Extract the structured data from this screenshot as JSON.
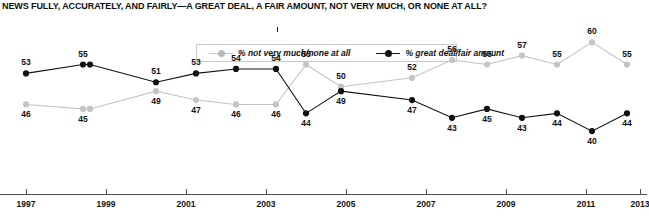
{
  "title": "NEWS FULLY, ACCURATELY, AND FAIRLY—A GREAT DEAL, A FAIR AMOUNT, NOT VERY MUCH, OR NONE AT ALL?",
  "legend": {
    "items": [
      {
        "label": "% not very much/none at all",
        "color": "#c4c4c4",
        "marker": "circle"
      },
      {
        "label": "% great deal/fair amount",
        "color": "#111111",
        "marker": "circle"
      }
    ]
  },
  "axis": {
    "x_ticks": [
      "1997",
      "1999",
      "2001",
      "2003",
      "2005",
      "2007",
      "2009",
      "2011",
      "2013"
    ]
  },
  "chart_data": {
    "type": "line",
    "title": "NEWS FULLY, ACCURATELY, AND FAIRLY—A GREAT DEAL, A FAIR AMOUNT, NOT VERY MUCH, OR NONE AT ALL?",
    "xlabel": "",
    "ylabel": "",
    "ylim": [
      38,
      62
    ],
    "grid": false,
    "legend_position": "top-center",
    "x": [
      1997,
      1999,
      1999.45,
      2001,
      2002,
      2003,
      2004,
      2005,
      2006,
      2008,
      2009,
      2010,
      2011,
      2012,
      2013,
      2014
    ],
    "x_pixels": [
      26,
      83,
      90,
      156,
      196,
      236,
      276,
      306,
      341,
      412,
      452,
      487,
      522,
      557,
      592,
      627
    ],
    "series": [
      {
        "name": "% not very much/none at all",
        "color": "#c4c4c4",
        "values": [
          46,
          45,
          45,
          49,
          47,
          46,
          46,
          55,
          50,
          52,
          56,
          55,
          57,
          55,
          60,
          55
        ],
        "label_side": "below_then_above",
        "labels": [
          {
            "value": 46,
            "pos": "below"
          },
          {
            "value": 45,
            "pos": "below"
          },
          {
            "value": null,
            "pos": "hidden"
          },
          {
            "value": 49,
            "pos": "below"
          },
          {
            "value": 47,
            "pos": "below"
          },
          {
            "value": 46,
            "pos": "below"
          },
          {
            "value": 46,
            "pos": "below"
          },
          {
            "value": 55,
            "pos": "above"
          },
          {
            "value": 50,
            "pos": "above"
          },
          {
            "value": 52,
            "pos": "above"
          },
          {
            "value": 56,
            "pos": "above"
          },
          {
            "value": 55,
            "pos": "above"
          },
          {
            "value": 57,
            "pos": "above"
          },
          {
            "value": 55,
            "pos": "above"
          },
          {
            "value": 60,
            "pos": "above"
          },
          {
            "value": 55,
            "pos": "above"
          }
        ]
      },
      {
        "name": "% great deal/fair amount",
        "color": "#111111",
        "values": [
          53,
          55,
          55,
          51,
          53,
          54,
          54,
          44,
          49,
          47,
          43,
          45,
          43,
          44,
          40,
          44
        ],
        "label_side": "above_then_below",
        "labels": [
          {
            "value": 53,
            "pos": "above"
          },
          {
            "value": 55,
            "pos": "above"
          },
          {
            "value": null,
            "pos": "hidden"
          },
          {
            "value": 51,
            "pos": "above"
          },
          {
            "value": 53,
            "pos": "above"
          },
          {
            "value": 54,
            "pos": "above"
          },
          {
            "value": 54,
            "pos": "above"
          },
          {
            "value": 44,
            "pos": "below"
          },
          {
            "value": 49,
            "pos": "below"
          },
          {
            "value": 47,
            "pos": "below"
          },
          {
            "value": 43,
            "pos": "below"
          },
          {
            "value": 45,
            "pos": "below"
          },
          {
            "value": 43,
            "pos": "below"
          },
          {
            "value": 44,
            "pos": "below"
          },
          {
            "value": 40,
            "pos": "below"
          },
          {
            "value": 44,
            "pos": "below"
          }
        ]
      }
    ]
  }
}
